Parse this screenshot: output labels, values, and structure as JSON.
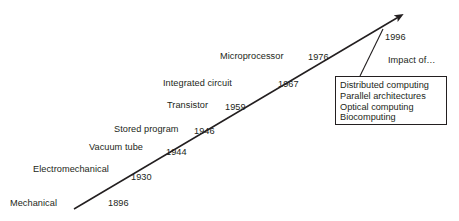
{
  "figure": {
    "type": "timeline-diagram",
    "colors": {
      "ink": "#231f20",
      "background": "#ffffff",
      "box_border": "#231f20"
    },
    "arrow": {
      "name": "timeline-arrow",
      "tail": {
        "x": 74,
        "y": 209
      },
      "tip": {
        "x": 402,
        "y": 14
      }
    },
    "leader_line": {
      "name": "callout-leader-line",
      "from": {
        "x": 383,
        "y": 29
      },
      "to": {
        "x": 360,
        "y": 76
      }
    }
  },
  "eras": [
    {
      "label": "Mechanical",
      "year": "1896",
      "label_x": 10,
      "label_y": 199,
      "year_x": 108,
      "year_y": 199
    },
    {
      "label": "Electromechanical",
      "year": "1930",
      "label_x": 33,
      "label_y": 165,
      "year_x": 131,
      "year_y": 173
    },
    {
      "label": "Vacuum tube",
      "year": "1944",
      "label_x": 89,
      "label_y": 143,
      "year_x": 166,
      "year_y": 148
    },
    {
      "label": "Stored program",
      "year": "1946",
      "label_x": 114,
      "label_y": 125,
      "year_x": 194,
      "year_y": 127
    },
    {
      "label": "Transistor",
      "year": "1959",
      "label_x": 167,
      "label_y": 101,
      "year_x": 225,
      "year_y": 103
    },
    {
      "label": "Integrated circuit",
      "year": "1967",
      "label_x": 163,
      "label_y": 79,
      "year_x": 278,
      "year_y": 80
    },
    {
      "label": "Microprocessor",
      "year": "1976",
      "label_x": 220,
      "label_y": 52,
      "year_x": 308,
      "year_y": 53
    }
  ],
  "callout": {
    "year": "1996",
    "title": "Impact of…",
    "items": [
      "Distributed computing",
      "Parallel architectures",
      "Optical computing",
      "Biocomputing"
    ]
  }
}
